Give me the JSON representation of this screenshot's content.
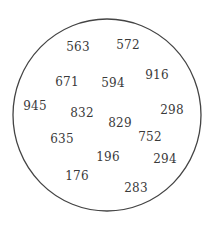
{
  "diagram": {
    "type": "set-circle",
    "circle": {
      "cx": 107,
      "cy": 115,
      "rx": 94,
      "ry": 96,
      "stroke": "#444444",
      "stroke_width": 1.3
    },
    "numbers": [
      {
        "value": "563",
        "x": 78,
        "y": 47
      },
      {
        "value": "572",
        "x": 128,
        "y": 45
      },
      {
        "value": "916",
        "x": 157,
        "y": 75
      },
      {
        "value": "671",
        "x": 67,
        "y": 82
      },
      {
        "value": "594",
        "x": 113,
        "y": 83
      },
      {
        "value": "945",
        "x": 35,
        "y": 106
      },
      {
        "value": "298",
        "x": 172,
        "y": 110
      },
      {
        "value": "832",
        "x": 82,
        "y": 113
      },
      {
        "value": "829",
        "x": 120,
        "y": 123
      },
      {
        "value": "635",
        "x": 62,
        "y": 139
      },
      {
        "value": "752",
        "x": 150,
        "y": 137
      },
      {
        "value": "196",
        "x": 108,
        "y": 157
      },
      {
        "value": "294",
        "x": 165,
        "y": 159
      },
      {
        "value": "176",
        "x": 77,
        "y": 176
      },
      {
        "value": "283",
        "x": 136,
        "y": 188
      }
    ]
  }
}
